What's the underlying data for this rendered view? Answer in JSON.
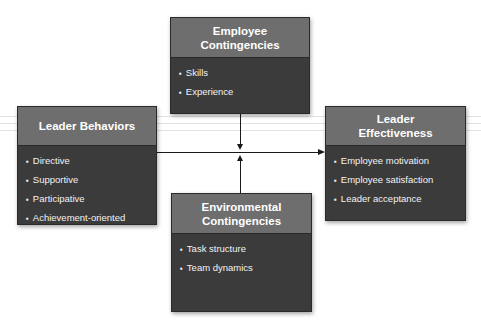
{
  "diagram": {
    "nodes": {
      "employee": {
        "title_line1": "Employee",
        "title_line2": "Contingencies",
        "items": [
          "Skills",
          "Experience"
        ]
      },
      "leader_behaviors": {
        "title_line1": "Leader Behaviors",
        "items": [
          "Directive",
          "Supportive",
          "Participative",
          "Achievement-oriented"
        ]
      },
      "effectiveness": {
        "title_line1": "Leader",
        "title_line2": "Effectiveness",
        "items": [
          "Employee motivation",
          "Employee satisfaction",
          "Leader acceptance"
        ]
      },
      "environmental": {
        "title_line1": "Environmental",
        "title_line2": "Contingencies",
        "items": [
          "Task structure",
          "Team dynamics"
        ]
      }
    },
    "edges": [
      {
        "from": "Leader Behaviors",
        "to": "Leader Effectiveness"
      },
      {
        "from": "Employee Contingencies",
        "to": "Leader Behaviors → Leader Effectiveness link"
      },
      {
        "from": "Environmental Contingencies",
        "to": "Leader Behaviors → Leader Effectiveness link"
      }
    ],
    "colors": {
      "header": "#6e6e6e",
      "body": "#3b3b3b",
      "text": "#ffffff",
      "line": "#1a1a1a"
    }
  }
}
